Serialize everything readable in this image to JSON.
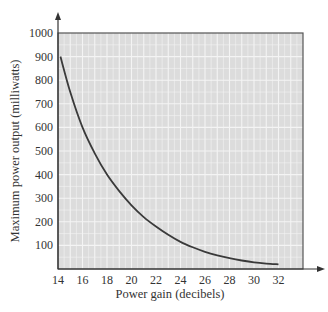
{
  "chart_data": {
    "type": "line",
    "title": "",
    "xlabel": "Power gain (decibels)",
    "ylabel": "Maximum power output (milliwatts)",
    "xlim": [
      14,
      34
    ],
    "ylim": [
      0,
      1000
    ],
    "xticks": [
      14,
      16,
      18,
      20,
      22,
      24,
      26,
      28,
      30,
      32
    ],
    "yticks": [
      100,
      200,
      300,
      400,
      500,
      600,
      700,
      800,
      900,
      1000
    ],
    "grid": true,
    "legend": null,
    "series": [
      {
        "name": "Maximum power output",
        "x": [
          14.2,
          15,
          16,
          17,
          18,
          19,
          20,
          21,
          22,
          23,
          24,
          25,
          26,
          27,
          28,
          29,
          30,
          31,
          32
        ],
        "y": [
          900,
          750,
          600,
          490,
          400,
          330,
          270,
          220,
          180,
          145,
          115,
          92,
          73,
          58,
          46,
          36,
          28,
          23,
          20
        ]
      }
    ]
  },
  "colors": {
    "plot_background": "#dcdcdc",
    "grid": "#f4f4f4",
    "curve": "#3a3a3a",
    "axis": "#333333"
  }
}
